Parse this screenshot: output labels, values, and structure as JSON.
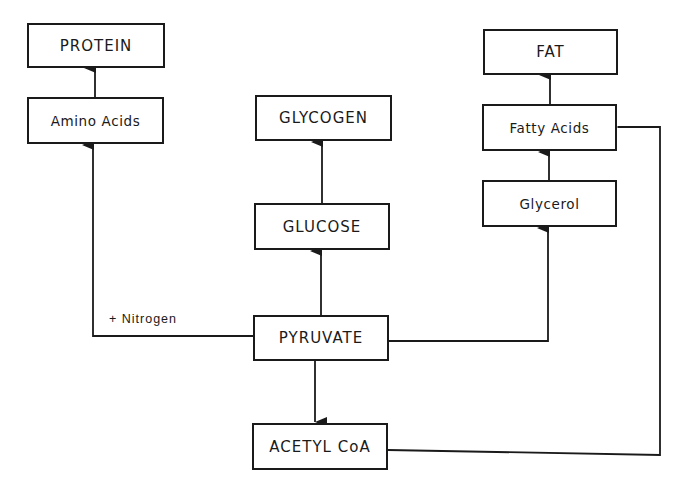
{
  "diagram": {
    "type": "flowchart",
    "nodes": {
      "protein": "PROTEIN",
      "amino_acids": "Amino Acids",
      "glycogen": "GLYCOGEN",
      "glucose": "GLUCOSE",
      "pyruvate": "PYRUVATE",
      "acetyl_coa": "ACETYL CoA",
      "fat": "FAT",
      "fatty_acids": "Fatty Acids",
      "glycerol": "Glycerol"
    },
    "edge_labels": {
      "nitrogen": "+ Nitrogen"
    },
    "edges": [
      {
        "from": "Amino Acids",
        "to": "PROTEIN"
      },
      {
        "from": "PYRUVATE",
        "to": "Amino Acids",
        "label": "+ Nitrogen"
      },
      {
        "from": "GLUCOSE",
        "to": "GLYCOGEN"
      },
      {
        "from": "PYRUVATE",
        "to": "GLUCOSE"
      },
      {
        "from": "PYRUVATE",
        "to": "Glycerol"
      },
      {
        "from": "PYRUVATE",
        "to": "ACETYL CoA"
      },
      {
        "from": "Glycerol",
        "to": "Fatty Acids"
      },
      {
        "from": "Fatty Acids",
        "to": "FAT"
      },
      {
        "from": "ACETYL CoA",
        "to": "Fatty Acids"
      }
    ],
    "colors": {
      "stroke": "#1a1a1a",
      "background": "#ffffff"
    }
  }
}
